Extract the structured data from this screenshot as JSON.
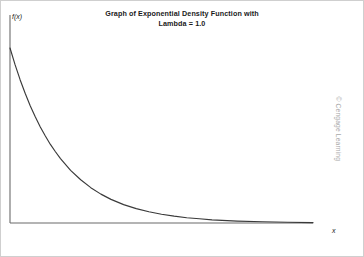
{
  "figure": {
    "title": "Graph of Exponential Density Function with\nLambda = 1.0",
    "watermark": "© Cengage Learning",
    "background_color": "#ffffff",
    "border_color": "#cfcfcf"
  },
  "chart_data": {
    "type": "line",
    "title": "Graph of Exponential Density Function with Lambda = 1.0",
    "xlabel": "x",
    "ylabel": "f(x)",
    "legend": null,
    "grid": false,
    "curve_color": "#3a3a3a",
    "axis_color": "#6b6b6b",
    "lambda": 1.0,
    "function": "f(x) = 1.0 * exp(-1.0 * x)",
    "xlim": [
      0,
      6
    ],
    "ylim": [
      0,
      1.15
    ],
    "x": [
      0,
      0.1,
      0.2,
      0.3,
      0.4,
      0.5,
      0.6,
      0.7,
      0.8,
      0.9,
      1.0,
      1.2,
      1.4,
      1.6,
      1.8,
      2.0,
      2.25,
      2.5,
      2.75,
      3.0,
      3.25,
      3.5,
      3.75,
      4.0,
      4.5,
      5.0,
      5.5,
      6.0
    ],
    "y": [
      1.0,
      0.905,
      0.819,
      0.741,
      0.67,
      0.607,
      0.549,
      0.497,
      0.449,
      0.407,
      0.368,
      0.301,
      0.247,
      0.202,
      0.165,
      0.135,
      0.105,
      0.082,
      0.064,
      0.05,
      0.039,
      0.03,
      0.024,
      0.018,
      0.011,
      0.007,
      0.004,
      0.002
    ],
    "x_ticks": [],
    "y_ticks": [],
    "annotations": []
  },
  "axes": {
    "y_label": "f(x)",
    "x_label": "x"
  }
}
